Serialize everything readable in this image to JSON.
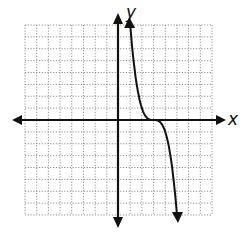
{
  "chart_data": {
    "type": "line",
    "title": "",
    "xlabel": "x",
    "ylabel": "y",
    "xlim": [
      -8,
      8
    ],
    "ylim": [
      -8,
      8
    ],
    "grid": true,
    "grid_style": "dotted",
    "tick_labels": false,
    "series": [
      {
        "name": "curve",
        "description": "decreasing cubic-like curve, approx y = -(x-3)^3, with arrows at both ends",
        "x": [
          1,
          1.5,
          2,
          2.5,
          3,
          3.5,
          4,
          4.5,
          5
        ],
        "values": [
          8,
          3.4,
          1,
          0.1,
          0,
          -0.1,
          -1,
          -3.4,
          -8
        ]
      }
    ],
    "annotations": [
      "arrowheads at both ends of curve",
      "arrowheads on all four axis ends"
    ]
  },
  "labels": {
    "x_axis": "x",
    "y_axis": "y"
  }
}
